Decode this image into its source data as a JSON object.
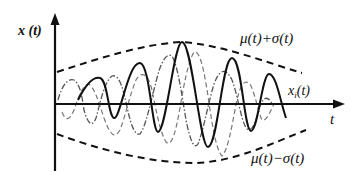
{
  "figure": {
    "labels": {
      "y_axis": "x (t)",
      "x_axis": "t",
      "upper_envelope": "μ(t)+σ(t)",
      "lower_envelope": "μ(t)−σ(t)",
      "sample_function": "x",
      "sample_function_subscript": "i",
      "sample_function_suffix": "(t)"
    },
    "colors": {
      "axis": "#111111",
      "solid_curve": "#111111",
      "envelope": "#111111",
      "dashdot_curve": "#555555",
      "dashed_curve": "#777777"
    },
    "curves": [
      {
        "name": "sample-function-xi",
        "style": "solid"
      },
      {
        "name": "realization-dashdot",
        "style": "dash-dot"
      },
      {
        "name": "realization-dashed",
        "style": "dashed"
      },
      {
        "name": "upper-envelope",
        "style": "dashed"
      },
      {
        "name": "lower-envelope",
        "style": "dashed"
      }
    ]
  }
}
